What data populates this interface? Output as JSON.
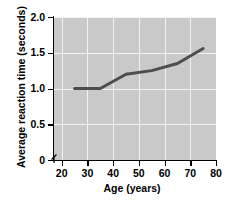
{
  "chart_data": {
    "type": "line",
    "title": "",
    "xlabel": "Age (years)",
    "ylabel": "Average reaction time (seconds)",
    "xlim": [
      17,
      80
    ],
    "ylim": [
      0,
      2.0
    ],
    "xticks": [
      20,
      30,
      40,
      50,
      60,
      70,
      80
    ],
    "xtick_labels": [
      "20",
      "30",
      "40",
      "50",
      "60",
      "70",
      "80"
    ],
    "yticks": [
      0,
      0.5,
      1.0,
      1.5,
      2.0
    ],
    "ytick_labels": [
      "0",
      "0.5",
      "1.0",
      "1.5",
      "2.0"
    ],
    "grid": true,
    "grid_color": "#f2f2f2",
    "plot_background": "#c9c9c9",
    "line_color": "#4d4d4d",
    "line_width": 3,
    "axis_break": true,
    "legend": null,
    "series": [
      {
        "name": "Average reaction time",
        "x": [
          25,
          35,
          45,
          55,
          65,
          75
        ],
        "values": [
          1.0,
          1.0,
          1.2,
          1.25,
          1.35,
          1.56
        ]
      }
    ]
  }
}
